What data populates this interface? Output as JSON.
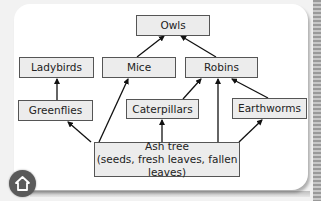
{
  "diagram": {
    "type": "food-web",
    "nodes": {
      "owls": "Owls",
      "ladybirds": "Ladybirds",
      "mice": "Mice",
      "robins": "Robins",
      "greenflies": "Greenflies",
      "caterpillars": "Caterpillars",
      "earthworms": "Earthworms",
      "ash_tree": "Ash tree",
      "ash_tree_detail": "(seeds, fresh leaves, fallen leaves)"
    },
    "edges": [
      {
        "from": "Mice",
        "to": "Owls"
      },
      {
        "from": "Robins",
        "to": "Owls"
      },
      {
        "from": "Greenflies",
        "to": "Ladybirds"
      },
      {
        "from": "Caterpillars",
        "to": "Robins"
      },
      {
        "from": "Ash tree",
        "to": "Robins"
      },
      {
        "from": "Earthworms",
        "to": "Robins"
      },
      {
        "from": "Ash tree",
        "to": "Greenflies"
      },
      {
        "from": "Ash tree",
        "to": "Mice"
      },
      {
        "from": "Ash tree",
        "to": "Caterpillars"
      },
      {
        "from": "Ash tree",
        "to": "Earthworms"
      }
    ]
  },
  "navigation": {
    "home_icon": "home-icon"
  },
  "colors": {
    "node_fill": "#ececec",
    "node_border": "#555555",
    "arrow": "#111111",
    "home_button": "#5a5a5a"
  }
}
